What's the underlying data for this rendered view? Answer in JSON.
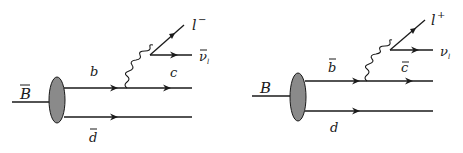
{
  "diagrams": [
    {
      "id": "bbar-decay",
      "meson": "B",
      "meson_bar": true,
      "upper_in": {
        "text": "b",
        "bar": false
      },
      "upper_out": {
        "text": "c",
        "bar": false
      },
      "lepton": {
        "text": "l",
        "sup": "−"
      },
      "neutrino": {
        "text": "ν",
        "sub": "l",
        "bar": true
      },
      "spectator": {
        "text": "d",
        "bar": true
      }
    },
    {
      "id": "b-decay",
      "meson": "B",
      "meson_bar": false,
      "upper_in": {
        "text": "b",
        "bar": true
      },
      "upper_out": {
        "text": "c",
        "bar": true
      },
      "lepton": {
        "text": "l",
        "sup": "+"
      },
      "neutrino": {
        "text": "ν",
        "sub": "l",
        "bar": false
      },
      "spectator": {
        "text": "d",
        "bar": false
      }
    }
  ],
  "colors": {
    "line": "#1a1a1a",
    "blob": "#8a8a8a",
    "background": "#ffffff"
  }
}
